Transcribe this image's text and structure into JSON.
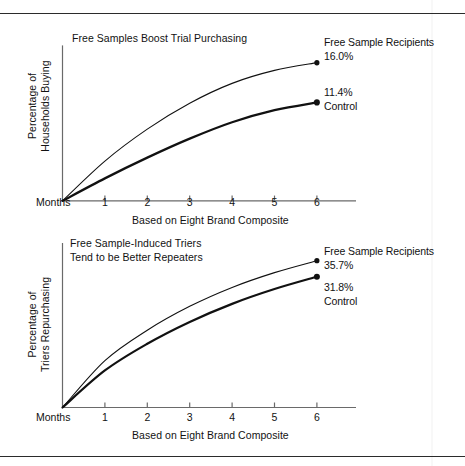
{
  "figure": {
    "background": "#ffffff",
    "ink": "#121212",
    "rules": {
      "top_y": 13,
      "bottom_y": 456
    }
  },
  "chart_data": [
    {
      "id": "top",
      "type": "line",
      "title": "Free Samples Boost Trial Purchasing",
      "xlabel": "Based on Eight Brand Composite",
      "ylabel": "Percentage of\nHouseholds Buying",
      "origin_label": "Months",
      "x": [
        0,
        1,
        2,
        3,
        4,
        5,
        6
      ],
      "tick_labels": [
        "1",
        "2",
        "3",
        "4",
        "5",
        "6"
      ],
      "xlim": [
        0,
        6
      ],
      "ylim": [
        0,
        18
      ],
      "grid": false,
      "legend_position": "right-end-of-line",
      "series": [
        {
          "name": "Free Sample Recipients",
          "end_value": "16.0%",
          "label": "Free Sample Recipients\n16.0%",
          "values": [
            0.0,
            4.6,
            8.3,
            11.3,
            13.6,
            15.1,
            16.0
          ],
          "stroke_width": 1.1,
          "color": "#111111"
        },
        {
          "name": "Control",
          "end_value": "11.4%",
          "label": "11.4%\nControl",
          "values": [
            0.0,
            2.6,
            5.0,
            7.2,
            9.1,
            10.5,
            11.4
          ],
          "stroke_width": 2.2,
          "color": "#111111"
        }
      ]
    },
    {
      "id": "bottom",
      "type": "line",
      "title": "Free Sample-Induced Triers\nTend to be Better Repeaters",
      "xlabel": "Based on Eight Brand Composite",
      "ylabel": "Percentage of\nTriers Repurchasing",
      "origin_label": "Months",
      "x": [
        0,
        1,
        2,
        3,
        4,
        5,
        6
      ],
      "tick_labels": [
        "1",
        "2",
        "3",
        "4",
        "5",
        "6"
      ],
      "xlim": [
        0,
        6
      ],
      "ylim": [
        0,
        40
      ],
      "grid": false,
      "legend_position": "right-end-of-line",
      "series": [
        {
          "name": "Free Sample Recipients",
          "end_value": "35.7%",
          "label": "Free Sample Recipients\n35.7%",
          "values": [
            0.0,
            11.4,
            18.8,
            24.6,
            29.2,
            32.8,
            35.7
          ],
          "stroke_width": 1.1,
          "color": "#111111"
        },
        {
          "name": "Control",
          "end_value": "31.8%",
          "label": "31.8%\nControl",
          "values": [
            0.0,
            9.0,
            15.5,
            20.8,
            25.2,
            28.8,
            31.8
          ],
          "stroke_width": 2.2,
          "color": "#111111"
        }
      ]
    }
  ]
}
